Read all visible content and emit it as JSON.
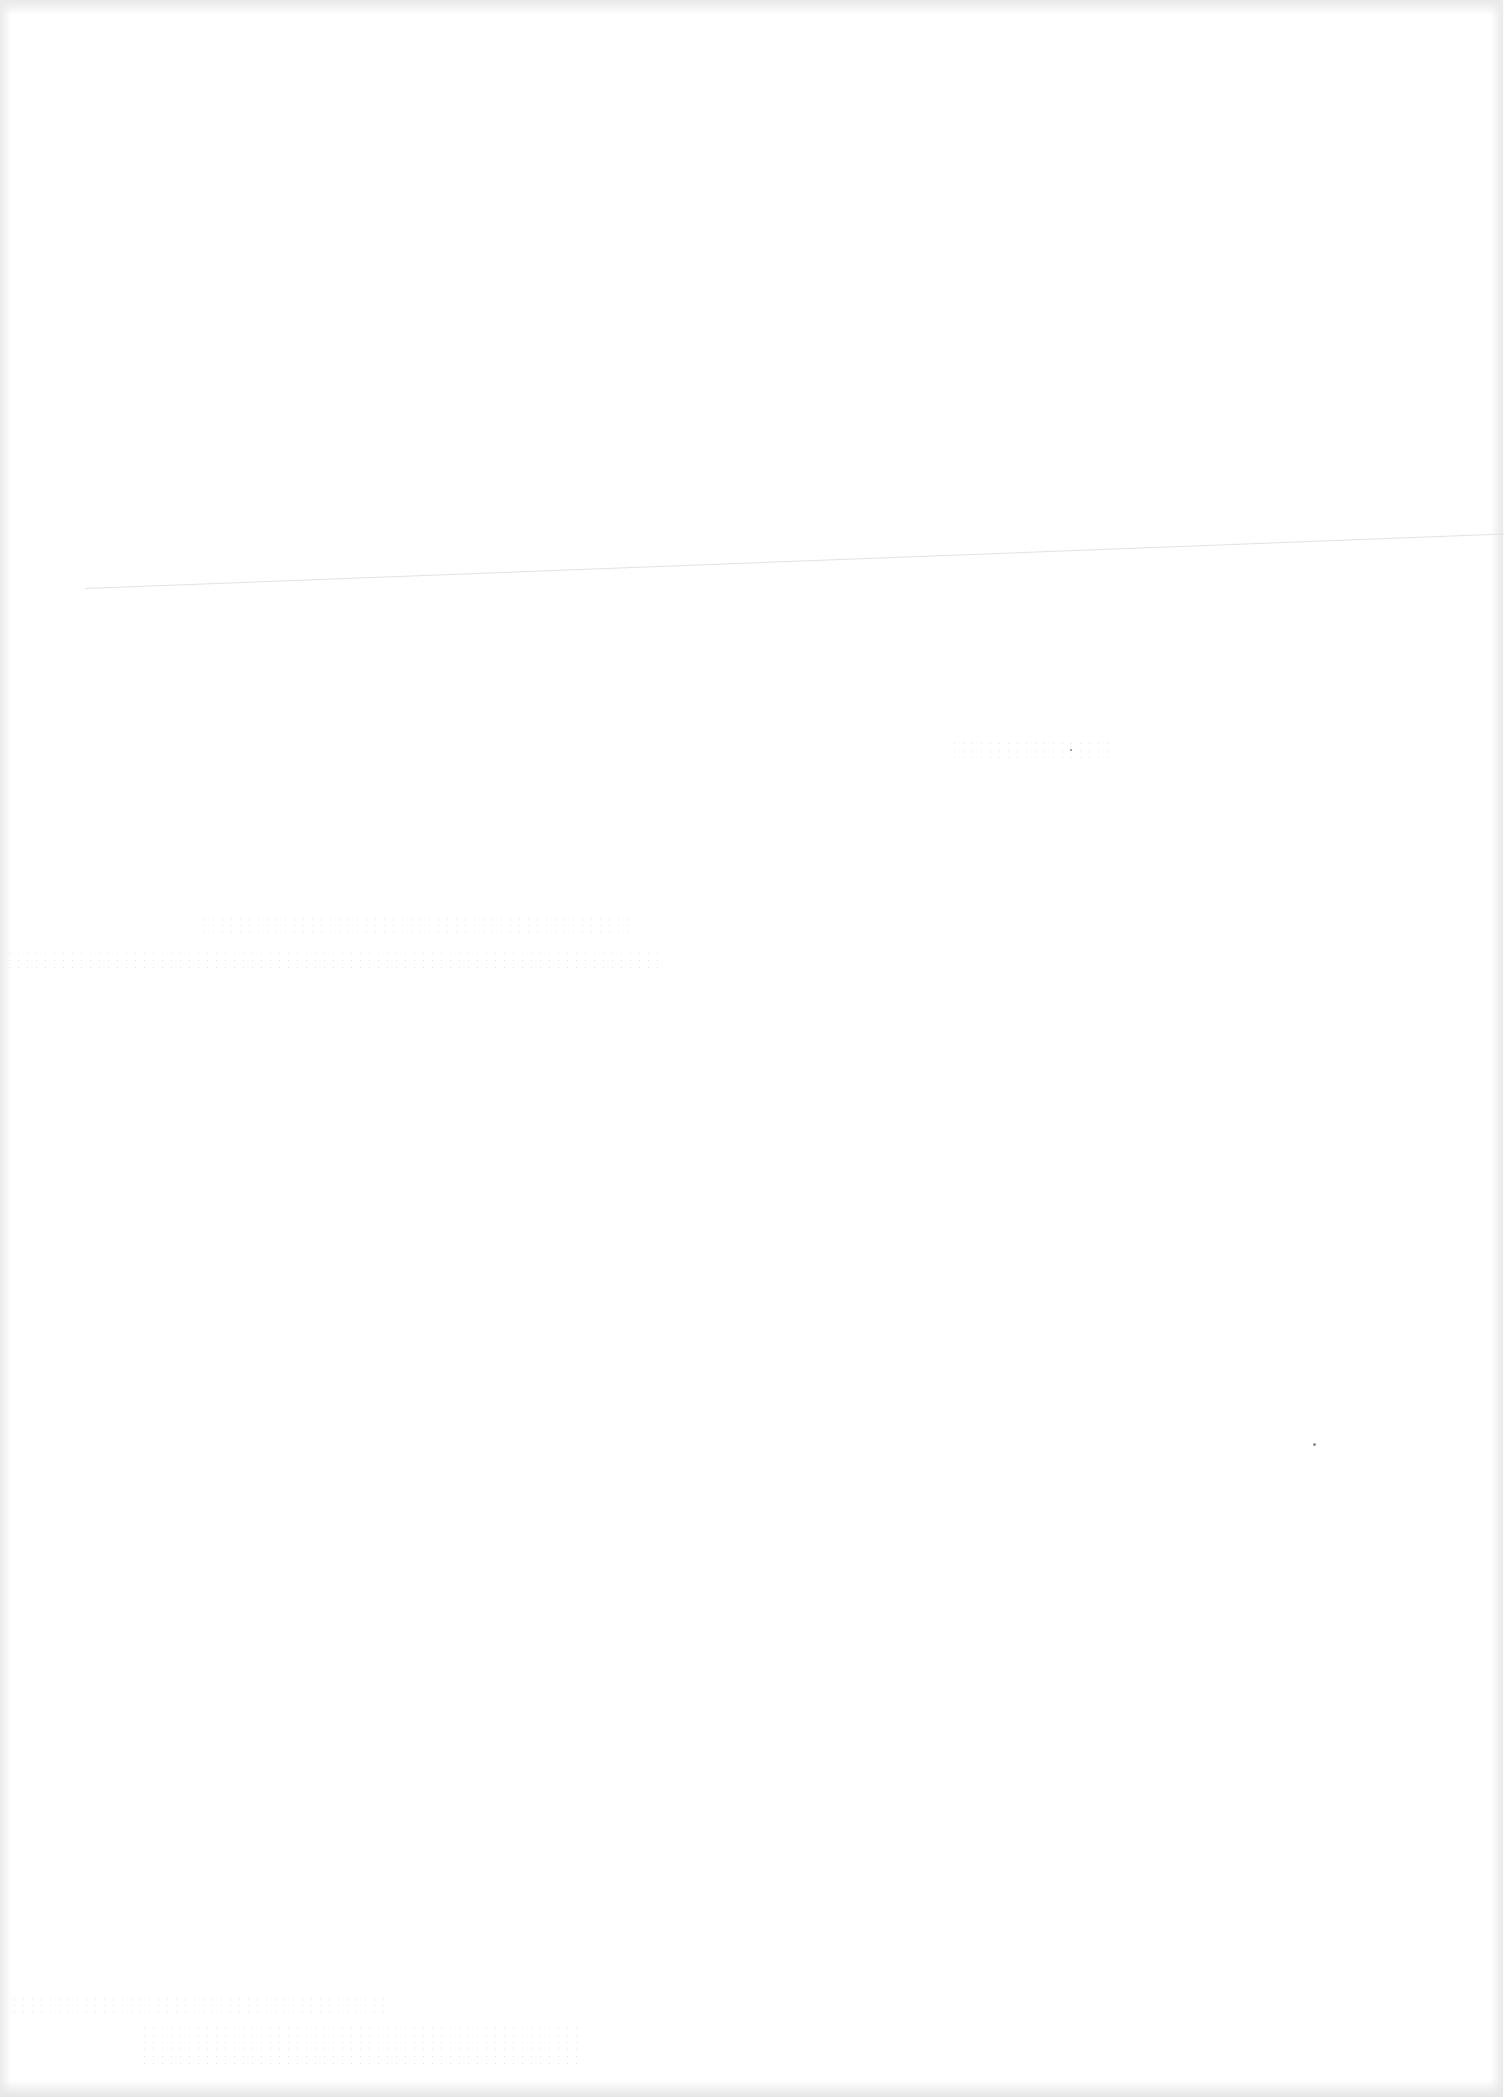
{
  "document": {
    "type": "blank-scanned-page",
    "text_content": [],
    "artifacts": {
      "fold_line": "faint diagonal crease across upper-middle of page",
      "bleed_through": "illegible show-through marks near mid-page and bottom-left",
      "specks": 2
    },
    "colors": {
      "paper": "#ffffff",
      "edge_shadow": "#e6e6e6",
      "fold_line": "#e2e2e2",
      "bleed": "#cfcfcf"
    }
  }
}
